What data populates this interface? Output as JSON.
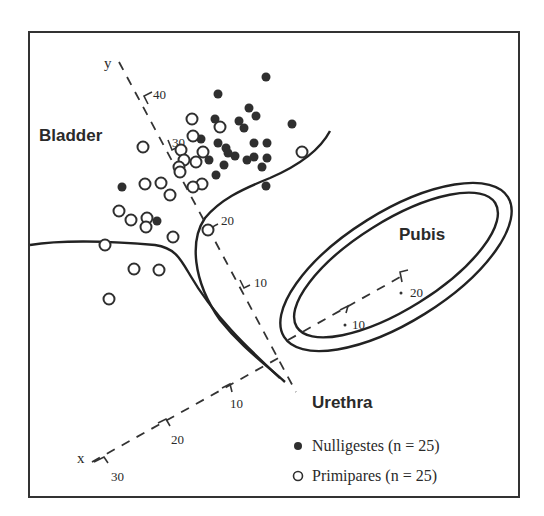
{
  "chart_data": {
    "type": "scatter",
    "title": "",
    "regions": [
      "Bladder",
      "Pubis",
      "Urethra"
    ],
    "axes": {
      "x": {
        "label": "x",
        "ticks": [
          "10",
          "20",
          "30"
        ]
      },
      "y": {
        "label": "y",
        "ticks": [
          "10",
          "20",
          "30",
          "40"
        ]
      },
      "pubis_axis": {
        "ticks": [
          "10",
          "20"
        ]
      }
    },
    "legend": [
      {
        "marker": "filled-circle",
        "label": "Nulligestes (n = 25)"
      },
      {
        "marker": "open-circle",
        "label": "Primipares (n = 25)"
      }
    ],
    "series": [
      {
        "name": "Nulligestes (n = 25)",
        "marker": "filled",
        "points_px": [
          [
            266,
            77
          ],
          [
            218,
            94
          ],
          [
            249,
            108
          ],
          [
            256,
            116
          ],
          [
            239,
            121
          ],
          [
            244,
            128
          ],
          [
            292,
            124
          ],
          [
            215,
            119
          ],
          [
            218,
            143
          ],
          [
            226,
            148
          ],
          [
            235,
            156
          ],
          [
            228,
            153
          ],
          [
            254,
            143
          ],
          [
            267,
            143
          ],
          [
            254,
            157
          ],
          [
            267,
            158
          ],
          [
            262,
            167
          ],
          [
            247,
            160
          ],
          [
            209,
            160
          ],
          [
            224,
            165
          ],
          [
            216,
            175
          ],
          [
            266,
            186
          ],
          [
            122,
            187
          ],
          [
            157,
            221
          ],
          [
            201,
            139
          ]
        ]
      },
      {
        "name": "Primipares (n = 25)",
        "marker": "open",
        "points_px": [
          [
            192,
            119
          ],
          [
            193,
            136
          ],
          [
            220,
            127
          ],
          [
            143,
            147
          ],
          [
            181,
            150
          ],
          [
            184,
            160
          ],
          [
            203,
            152
          ],
          [
            179,
            167
          ],
          [
            196,
            162
          ],
          [
            180,
            172
          ],
          [
            202,
            184
          ],
          [
            145,
            184
          ],
          [
            161,
            183
          ],
          [
            170,
            195
          ],
          [
            193,
            187
          ],
          [
            119,
            211
          ],
          [
            131,
            220
          ],
          [
            147,
            218
          ],
          [
            146,
            227
          ],
          [
            173,
            237
          ],
          [
            208,
            230
          ],
          [
            105,
            245
          ],
          [
            134,
            269
          ],
          [
            159,
            270
          ],
          [
            109,
            299
          ],
          [
            302,
            152
          ]
        ]
      }
    ]
  },
  "labels": {
    "bladder": "Bladder",
    "pubis": "Pubis",
    "urethra": "Urethra",
    "y_axis": "y",
    "x_axis": "x",
    "y_ticks": [
      "40",
      "30",
      "20",
      "10"
    ],
    "x_ticks": [
      "10",
      "20",
      "30"
    ],
    "pubis_ticks": [
      "10",
      "20"
    ]
  },
  "legend": {
    "nulligestes": "Nulligestes (n = 25)",
    "primipares": "Primipares (n = 25)"
  }
}
